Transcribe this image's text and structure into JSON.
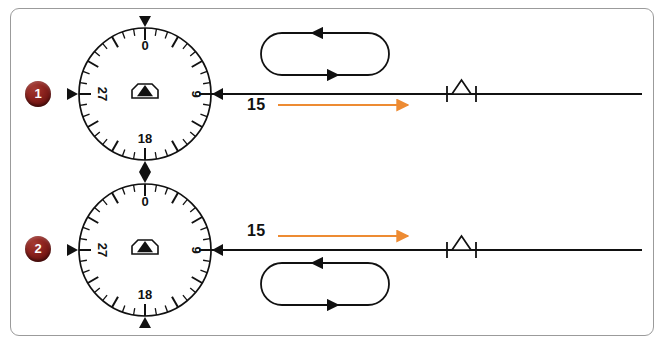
{
  "diagram": {
    "background_color": "#ffffff",
    "border_color": "#9b9b9b",
    "accent_color": "#ED8B33",
    "badge_color": "#8e241f",
    "line_color": "#111111"
  },
  "compass": {
    "labels": {
      "north": "0",
      "east": "9",
      "south": "18",
      "west": "27"
    },
    "tick_count": 36,
    "aircraft_symbol": "hexagon-with-triangle",
    "index_marker": "triangle-pointer"
  },
  "rows": [
    {
      "id": 1,
      "badge": "1",
      "course_label": "15",
      "course_arrow_color": "#ED8B33",
      "holding_pattern": {
        "position": "above-course-line",
        "top_leg_direction": "left",
        "bottom_leg_direction": "right",
        "turn_direction": "right-hand"
      },
      "fix_symbol": "triangle-intersection"
    },
    {
      "id": 2,
      "badge": "2",
      "course_label": "15",
      "course_arrow_color": "#ED8B33",
      "holding_pattern": {
        "position": "below-course-line",
        "top_leg_direction": "left",
        "bottom_leg_direction": "right",
        "turn_direction": "right-hand"
      },
      "fix_symbol": "triangle-intersection"
    }
  ]
}
